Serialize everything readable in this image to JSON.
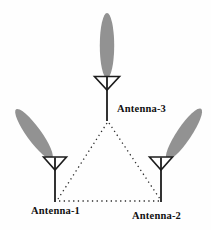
{
  "diagram": {
    "type": "antenna-array-diagram",
    "antennas": [
      {
        "id": "antenna-1",
        "label": "Antenna-1",
        "position": "bottom-left",
        "beam_direction": "up-left"
      },
      {
        "id": "antenna-2",
        "label": "Antenna-2",
        "position": "bottom-right",
        "beam_direction": "up-right"
      },
      {
        "id": "antenna-3",
        "label": "Antenna-3",
        "position": "top-center",
        "beam_direction": "up"
      }
    ],
    "links": [
      {
        "from": "Antenna-3",
        "to": "Antenna-1",
        "style": "dotted"
      },
      {
        "from": "Antenna-3",
        "to": "Antenna-2",
        "style": "dotted"
      },
      {
        "from": "Antenna-1",
        "to": "Antenna-2",
        "style": "dotted"
      }
    ],
    "colors": {
      "beam": "#929292",
      "line": "#1c1c1c",
      "dotted": "#2b2b2b",
      "symbol_fill": "#ffffff",
      "background": "#fefefe",
      "text": "#111111"
    }
  }
}
